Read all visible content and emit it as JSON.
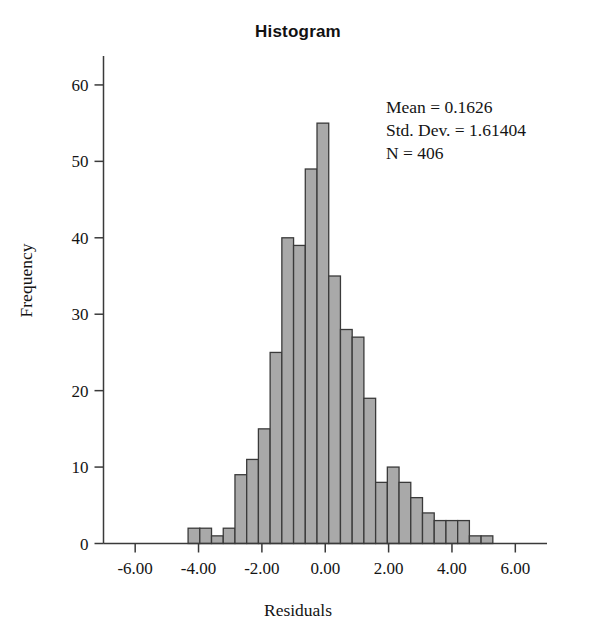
{
  "chart_data": {
    "type": "bar",
    "title": "Histogram",
    "xlabel": "Residuals",
    "ylabel": "Frequency",
    "xlim": [
      -7.0,
      7.0
    ],
    "ylim": [
      0,
      63
    ],
    "grid": false,
    "legend": "none",
    "xticks": [
      "-6.00",
      "-4.00",
      "-2.00",
      "0.00",
      "2.00",
      "4.00",
      "6.00"
    ],
    "xtick_values": [
      -6,
      -4,
      -2,
      0,
      2,
      4,
      6
    ],
    "yticks": [
      "0",
      "10",
      "20",
      "30",
      "40",
      "50",
      "60"
    ],
    "ytick_values": [
      0,
      10,
      20,
      30,
      40,
      50,
      60
    ],
    "bin_width": 0.37,
    "bin_starts": [
      -4.33,
      -3.96,
      -3.59,
      -3.22,
      -2.85,
      -2.48,
      -2.11,
      -1.74,
      -1.37,
      -1.0,
      -0.63,
      -0.26,
      0.11,
      0.48,
      0.85,
      1.22,
      1.59,
      1.96,
      2.33,
      2.7,
      3.07,
      3.44,
      3.81,
      4.18,
      4.55,
      4.92,
      5.29,
      5.66
    ],
    "values": [
      2,
      2,
      1,
      2,
      9,
      11,
      15,
      25,
      40,
      39,
      49,
      55,
      35,
      28,
      27,
      19,
      8,
      10,
      8,
      6,
      4,
      3,
      3,
      3,
      1,
      1
    ],
    "bars": [
      {
        "x0": -4.33,
        "x1": -3.96,
        "h": 2
      },
      {
        "x0": -3.96,
        "x1": -3.59,
        "h": 2
      },
      {
        "x0": -3.59,
        "x1": -3.22,
        "h": 1
      },
      {
        "x0": -3.22,
        "x1": -2.85,
        "h": 2
      },
      {
        "x0": -2.85,
        "x1": -2.48,
        "h": 9
      },
      {
        "x0": -2.48,
        "x1": -2.11,
        "h": 11
      },
      {
        "x0": -2.11,
        "x1": -1.74,
        "h": 15
      },
      {
        "x0": -1.74,
        "x1": -1.37,
        "h": 25
      },
      {
        "x0": -1.37,
        "x1": -1.0,
        "h": 40
      },
      {
        "x0": -1.0,
        "x1": -0.63,
        "h": 39
      },
      {
        "x0": -0.63,
        "x1": -0.26,
        "h": 49
      },
      {
        "x0": -0.26,
        "x1": 0.11,
        "h": 55
      },
      {
        "x0": 0.11,
        "x1": 0.48,
        "h": 35
      },
      {
        "x0": 0.48,
        "x1": 0.85,
        "h": 28
      },
      {
        "x0": 0.85,
        "x1": 1.22,
        "h": 27
      },
      {
        "x0": 1.22,
        "x1": 1.59,
        "h": 19
      },
      {
        "x0": 1.59,
        "x1": 1.96,
        "h": 8
      },
      {
        "x0": 1.96,
        "x1": 2.33,
        "h": 10
      },
      {
        "x0": 2.33,
        "x1": 2.7,
        "h": 8
      },
      {
        "x0": 2.7,
        "x1": 3.07,
        "h": 6
      },
      {
        "x0": 3.07,
        "x1": 3.44,
        "h": 4
      },
      {
        "x0": 3.44,
        "x1": 3.81,
        "h": 3
      },
      {
        "x0": 3.81,
        "x1": 4.18,
        "h": 3
      },
      {
        "x0": 4.18,
        "x1": 4.55,
        "h": 3
      },
      {
        "x0": 4.55,
        "x1": 4.92,
        "h": 1
      },
      {
        "x0": 4.92,
        "x1": 5.29,
        "h": 1
      }
    ],
    "annotations": {
      "mean_label": "Mean = 0.1626",
      "std_label": "Std. Dev. = 1.61404",
      "n_label": "N = 406"
    },
    "style": {
      "bar_fill": "#a9a9a9",
      "bar_stroke": "#3a3a3a",
      "axis_color": "#3a3a3a",
      "background": "#ffffff"
    }
  },
  "statistics": {
    "mean": "Mean = 0.1626",
    "std_dev": "Std. Dev. = 1.61404",
    "n": "N = 406"
  },
  "labels": {
    "title": "Histogram",
    "x_axis": "Residuals",
    "y_axis": "Frequency"
  }
}
